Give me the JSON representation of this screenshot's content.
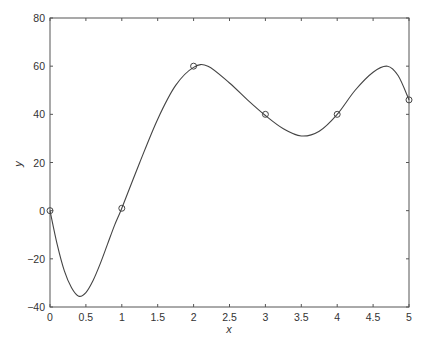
{
  "chart_data": {
    "type": "line",
    "title": "",
    "xlabel": "x",
    "ylabel": "y",
    "xlim": [
      0,
      5
    ],
    "ylim": [
      -40,
      80
    ],
    "grid": false,
    "legend": null,
    "x_ticks": [
      0,
      0.5,
      1,
      1.5,
      2,
      2.5,
      3,
      3.5,
      4,
      4.5,
      5
    ],
    "x_tick_labels": [
      "0",
      "0.5",
      "1",
      "1.5",
      "2",
      "2.5",
      "3",
      "3.5",
      "4",
      "4.5",
      "5"
    ],
    "y_ticks": [
      -40,
      -20,
      0,
      20,
      40,
      60,
      80
    ],
    "y_tick_labels": [
      "−40",
      "−20",
      "0",
      "20",
      "40",
      "60",
      "80"
    ],
    "series": [
      {
        "name": "interpolating curve",
        "style": "line",
        "color": "#444444",
        "x": [
          0,
          0.1,
          0.2,
          0.3,
          0.4,
          0.5,
          0.6,
          0.7,
          0.8,
          0.9,
          1.0,
          1.25,
          1.5,
          1.75,
          2.0,
          2.2,
          2.5,
          2.75,
          3.0,
          3.25,
          3.5,
          3.75,
          4.0,
          4.25,
          4.5,
          4.7,
          4.85,
          5.0
        ],
        "values": [
          0,
          -14,
          -25,
          -32,
          -35.5,
          -34,
          -29,
          -22,
          -14,
          -6,
          1,
          20,
          38,
          52,
          59.5,
          60,
          53,
          46,
          39.5,
          34,
          31,
          33,
          40,
          50,
          57.5,
          60,
          56,
          46
        ]
      },
      {
        "name": "data points",
        "style": "marker-circle",
        "color": "#444444",
        "x": [
          0,
          1,
          2,
          3,
          4,
          5
        ],
        "values": [
          0,
          1,
          60,
          40,
          40,
          46
        ]
      }
    ]
  }
}
